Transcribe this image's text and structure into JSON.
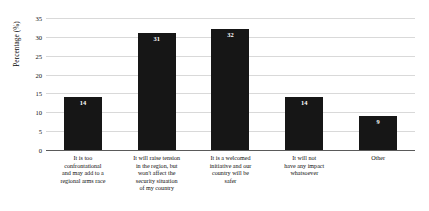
{
  "chart_data": {
    "type": "bar",
    "title": "",
    "xlabel": "",
    "ylabel": "Percentage (%)",
    "ylim": [
      0,
      35
    ],
    "ytick_step": 5,
    "yticks": [
      35,
      30,
      25,
      20,
      15,
      10,
      5,
      0
    ],
    "grid": true,
    "legend": "none",
    "bar_color": "#161616",
    "gridline_color": "#d9d9d9",
    "categories": [
      "It is too confrontational and may add to a regional arms race",
      "It will raise tension in the region, but won't affect the security situation of my country",
      "It is a welcomed initiative and our country will be safer",
      "It will not have any impact whatsoever",
      "Other"
    ],
    "category_lines": [
      [
        "It is too",
        "confrontational",
        "and may add to a",
        "regional arms race"
      ],
      [
        "It will raise tension",
        "in the region, but",
        "won't affect the",
        "security situation",
        "of my country"
      ],
      [
        "It is a welcomed",
        "initiative and our",
        "country will be",
        "safer"
      ],
      [
        "It will not",
        "have any impact",
        "whatsoever"
      ],
      [
        "Other"
      ]
    ],
    "values": [
      14,
      31,
      32,
      14,
      9
    ],
    "value_labels": [
      "14",
      "31",
      "32",
      "14",
      "9"
    ]
  }
}
